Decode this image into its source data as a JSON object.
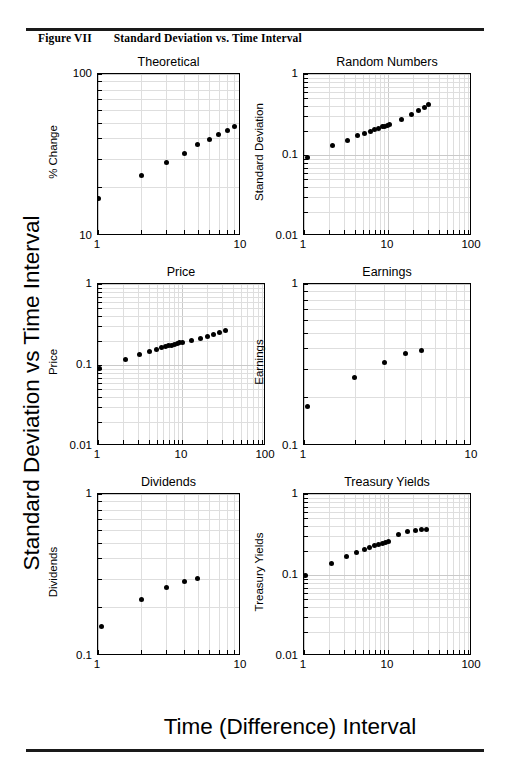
{
  "figure": {
    "caption_number": "Figure VII",
    "caption_title": "Standard Deviation vs. Time Interval",
    "outer_ylabel": "Standard Deviation vs Time Interval",
    "outer_xlabel": "Time  (Difference) Interval"
  },
  "chart_data": [
    {
      "type": "scatter",
      "title": "Theoretical",
      "xlabel": "",
      "ylabel": "% Change",
      "xscale": "log",
      "yscale": "log",
      "xlim": [
        1,
        10
      ],
      "ylim": [
        10,
        100
      ],
      "xticks": [
        1,
        10
      ],
      "xticklabels": [
        "1",
        "10"
      ],
      "yticks": [
        10,
        100
      ],
      "yticklabels": [
        "10",
        "100"
      ],
      "grid": true,
      "x": [
        1,
        2,
        3,
        4,
        5,
        6,
        7,
        8,
        9
      ],
      "y": [
        17.0,
        23.5,
        28.5,
        32.5,
        36.5,
        39.5,
        42.5,
        45.0,
        47.5
      ]
    },
    {
      "type": "scatter",
      "title": "Random Numbers",
      "xlabel": "",
      "ylabel": "Standard Deviation",
      "xscale": "log",
      "yscale": "log",
      "xlim": [
        1,
        100
      ],
      "ylim": [
        0.01,
        1
      ],
      "xticks": [
        1,
        10,
        100
      ],
      "xticklabels": [
        "1",
        "10",
        "100"
      ],
      "yticks": [
        0.01,
        0.1,
        1
      ],
      "yticklabels": [
        "0.01",
        "0.1",
        "1"
      ],
      "grid": true,
      "x": [
        1.1,
        2.2,
        3.3,
        4.3,
        5.3,
        6.2,
        7.0,
        7.8,
        8.5,
        9.2,
        9.8,
        10.3,
        14.5,
        19.0,
        23.0,
        27.0,
        30.0
      ],
      "y": [
        0.094,
        0.132,
        0.152,
        0.172,
        0.185,
        0.197,
        0.207,
        0.215,
        0.222,
        0.228,
        0.234,
        0.238,
        0.275,
        0.32,
        0.355,
        0.388,
        0.425
      ]
    },
    {
      "type": "scatter",
      "title": "Price",
      "xlabel": "",
      "ylabel": "Price",
      "xscale": "log",
      "yscale": "log",
      "xlim": [
        1,
        100
      ],
      "ylim": [
        0.01,
        1
      ],
      "xticks": [
        1,
        10,
        100
      ],
      "xticklabels": [
        "1",
        "10",
        "100"
      ],
      "yticks": [
        0.01,
        0.1,
        1
      ],
      "yticklabels": [
        "0.01",
        "0.1",
        "1"
      ],
      "grid": true,
      "x": [
        1.05,
        2.1,
        3.1,
        4.1,
        5.0,
        5.7,
        6.4,
        7.0,
        7.6,
        8.2,
        8.8,
        9.4,
        10.0,
        13.0,
        16.5,
        20.0,
        24.0,
        28.0,
        33.0
      ],
      "y": [
        0.09,
        0.118,
        0.133,
        0.148,
        0.157,
        0.163,
        0.168,
        0.172,
        0.176,
        0.18,
        0.184,
        0.188,
        0.192,
        0.203,
        0.215,
        0.228,
        0.24,
        0.252,
        0.265
      ]
    },
    {
      "type": "scatter",
      "title": "Earnings",
      "xlabel": "",
      "ylabel": "Earnings",
      "xscale": "log",
      "yscale": "log",
      "xlim": [
        1,
        10
      ],
      "ylim": [
        0.1,
        1
      ],
      "xticks": [
        1,
        10
      ],
      "xticklabels": [
        "1",
        "10"
      ],
      "yticks": [
        0.1,
        1
      ],
      "yticklabels": [
        "0.1",
        "1"
      ],
      "grid": true,
      "x": [
        1.05,
        2.0,
        3.0,
        4.0,
        5.0
      ],
      "y": [
        0.175,
        0.265,
        0.33,
        0.37,
        0.39
      ]
    },
    {
      "type": "scatter",
      "title": "Dividends",
      "xlabel": "",
      "ylabel": "Dividends",
      "xscale": "log",
      "yscale": "log",
      "xlim": [
        1,
        10
      ],
      "ylim": [
        0.1,
        1
      ],
      "xticks": [
        1,
        10
      ],
      "xticklabels": [
        "1",
        "10"
      ],
      "yticks": [
        0.1,
        1
      ],
      "yticklabels": [
        "0.1",
        "1"
      ],
      "grid": true,
      "x": [
        1.05,
        2.0,
        3.0,
        4.0,
        5.0
      ],
      "y": [
        0.153,
        0.222,
        0.263,
        0.29,
        0.3
      ]
    },
    {
      "type": "scatter",
      "title": "Treasury Yields",
      "xlabel": "",
      "ylabel": "Treasury Yields",
      "xscale": "log",
      "yscale": "log",
      "xlim": [
        1,
        100
      ],
      "ylim": [
        0.01,
        1
      ],
      "xticks": [
        1,
        10,
        100
      ],
      "xticklabels": [
        "1",
        "10",
        "100"
      ],
      "yticks": [
        0.01,
        0.1,
        1
      ],
      "yticklabels": [
        "0.01",
        "0.1",
        "1"
      ],
      "grid": true,
      "x": [
        1.05,
        2.1,
        3.2,
        4.2,
        5.2,
        6.1,
        7.0,
        7.8,
        8.6,
        9.3,
        10.0,
        13.5,
        17.0,
        21.0,
        25.0,
        29.0
      ],
      "y": [
        0.1,
        0.14,
        0.17,
        0.188,
        0.205,
        0.218,
        0.23,
        0.24,
        0.248,
        0.255,
        0.262,
        0.32,
        0.345,
        0.355,
        0.36,
        0.362
      ]
    }
  ],
  "layout": {
    "panels": [
      {
        "left": 97,
        "top": 73,
        "width": 143,
        "height": 162
      },
      {
        "left": 303,
        "top": 73,
        "width": 168,
        "height": 162
      },
      {
        "left": 97,
        "top": 283,
        "width": 168,
        "height": 162
      },
      {
        "left": 303,
        "top": 283,
        "width": 168,
        "height": 162
      },
      {
        "left": 97,
        "top": 493,
        "width": 143,
        "height": 162
      },
      {
        "left": 303,
        "top": 493,
        "width": 168,
        "height": 162
      }
    ]
  }
}
